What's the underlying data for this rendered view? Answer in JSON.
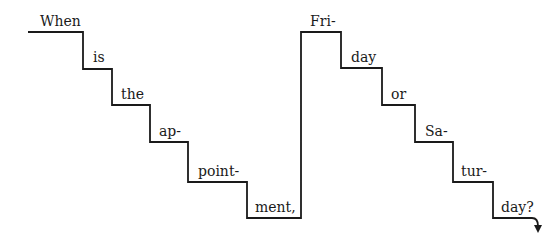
{
  "diagram": {
    "type": "intonation-staircase",
    "colors": {
      "line": "#1a1a1a",
      "text": "#1a1a1a",
      "background": "#ffffff"
    },
    "syllables": [
      {
        "text": "When",
        "x": 40,
        "y": 26
      },
      {
        "text": "is",
        "x": 93,
        "y": 62
      },
      {
        "text": "the",
        "x": 121,
        "y": 99
      },
      {
        "text": "ap-",
        "x": 159,
        "y": 136
      },
      {
        "text": "point-",
        "x": 198,
        "y": 176
      },
      {
        "text": "ment,",
        "x": 255,
        "y": 212
      },
      {
        "text": "Fri-",
        "x": 310,
        "y": 26
      },
      {
        "text": "day",
        "x": 351,
        "y": 62
      },
      {
        "text": "or",
        "x": 391,
        "y": 99
      },
      {
        "text": "Sa-",
        "x": 425,
        "y": 136
      },
      {
        "text": "tur-",
        "x": 461,
        "y": 176
      },
      {
        "text": "day?",
        "x": 501,
        "y": 212
      }
    ],
    "path_points": [
      [
        28,
        32
      ],
      [
        83,
        32
      ],
      [
        83,
        69
      ],
      [
        112,
        69
      ],
      [
        112,
        105
      ],
      [
        150,
        105
      ],
      [
        150,
        142
      ],
      [
        188,
        142
      ],
      [
        188,
        182
      ],
      [
        247,
        182
      ],
      [
        247,
        218
      ],
      [
        301,
        218
      ],
      [
        301,
        32
      ],
      [
        341,
        32
      ],
      [
        341,
        68
      ],
      [
        382,
        68
      ],
      [
        382,
        105
      ],
      [
        415,
        105
      ],
      [
        415,
        142
      ],
      [
        453,
        142
      ],
      [
        453,
        182
      ],
      [
        493,
        182
      ],
      [
        493,
        218
      ],
      [
        532,
        218
      ]
    ],
    "final_contour": {
      "shape": "falling-arrow",
      "end_x": 538,
      "end_y": 232,
      "arrow_icon": "arrow-down-icon"
    }
  }
}
